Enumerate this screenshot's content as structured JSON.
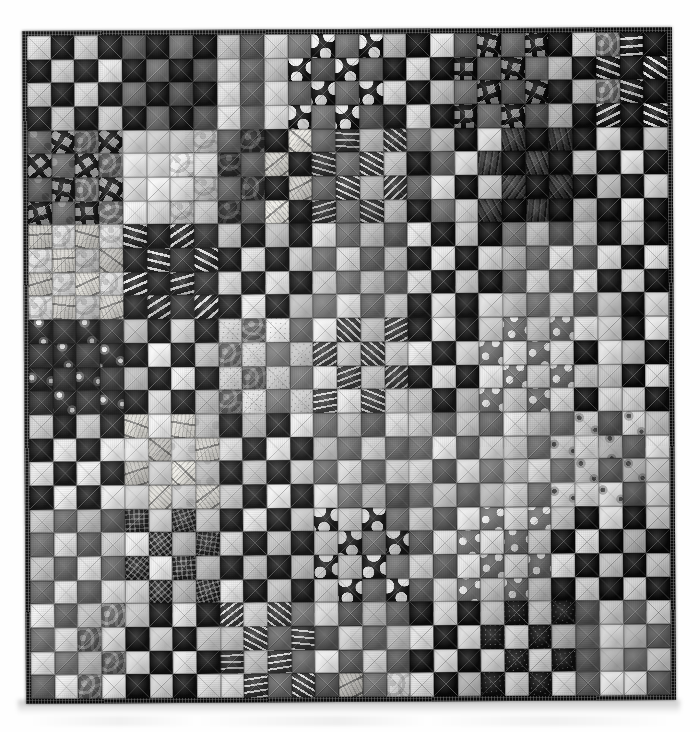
{
  "image": {
    "subject": "patchwork-quilt",
    "title": "Black and white scrappy checkerboard patchwork quilt",
    "background_color": "#ffffff",
    "orientation": "square"
  },
  "quilt": {
    "pattern_name": "Single Irish Chain / scrappy checkerboard",
    "colorway": "black and white",
    "columns": 27,
    "rows": 28,
    "binding_color": "#0d0d0d",
    "binding_label": "pieced black-and-white binding",
    "quilting_label": "diagonal crosshatch machine quilting",
    "fabric_legend": [
      {
        "key": "f-blk",
        "label": "solid black"
      },
      {
        "key": "f-dot-lgw",
        "label": "large white dots on black"
      },
      {
        "key": "f-dot-md",
        "label": "white dots on grey"
      },
      {
        "key": "f-grid-bold",
        "label": "bold black window-pane grid on grey"
      },
      {
        "key": "f-check-fine",
        "label": "fine black gingham check"
      },
      {
        "key": "f-strip-h",
        "label": "white ticking stripe on black"
      },
      {
        "key": "f-strip-v",
        "label": "vertical stripe"
      },
      {
        "key": "f-floral-d",
        "label": "white floral on black"
      },
      {
        "key": "f-floral-l",
        "label": "black floral on white"
      },
      {
        "key": "f-text-l",
        "label": "black script text print on cream"
      },
      {
        "key": "f-swirl-m",
        "label": "grey tonal swirl"
      },
      {
        "key": "f-speck-d",
        "label": "white speckle on black"
      },
      {
        "key": "f-net-d",
        "label": "black crosshatch net"
      },
      {
        "key": "f-wht",
        "label": "white tonal"
      }
    ],
    "grid": [
      [
        "f-lt2",
        "f-blk",
        "f-wht",
        "f-blk2",
        "f-md",
        "f-blk",
        "f-md2",
        "f-blk",
        "f-lt2",
        "f-md",
        "f-wht",
        "f-md2",
        "f-dot-lgw",
        "f-md2",
        "f-dot-lgw",
        "f-lt2",
        "f-blk",
        "f-lt2",
        "f-md",
        "f-grid-bold",
        "f-md2",
        "f-grid-bold",
        "f-blk",
        "f-wht",
        "f-swirl-m",
        "f-strip-h",
        "f-blk"
      ],
      [
        "f-blk",
        "f-wht",
        "f-blk2",
        "f-lt2",
        "f-blk",
        "f-md2",
        "f-blk",
        "f-md",
        "f-wht",
        "f-md2",
        "f-lt2",
        "f-dot-lgw",
        "f-md",
        "f-dot-lgw",
        "f-md2",
        "f-blk",
        "f-wht2",
        "f-blk",
        "f-grid-bold",
        "f-md",
        "f-grid-bold",
        "f-md2",
        "f-lt2",
        "f-blk",
        "f-strip-h",
        "f-blk2",
        "f-strip-h"
      ],
      [
        "f-wht",
        "f-blk",
        "f-lt2",
        "f-blk2",
        "f-md2",
        "f-blk",
        "f-md",
        "f-blk",
        "f-lt2",
        "f-md",
        "f-wht2",
        "f-md2",
        "f-dot-lgw",
        "f-md2",
        "f-dot-lgw",
        "f-wht",
        "f-blk",
        "f-lt2",
        "f-md2",
        "f-grid-bold",
        "f-md",
        "f-grid-bold",
        "f-blk2",
        "f-lt2",
        "f-swirl-m",
        "f-strip-h",
        "f-blk"
      ],
      [
        "f-blk2",
        "f-lt2",
        "f-blk",
        "f-wht",
        "f-blk",
        "f-md2",
        "f-blk",
        "f-md",
        "f-wht",
        "f-md2",
        "f-lt2",
        "f-dot-lgw",
        "f-md2",
        "f-dot-lgw",
        "f-md",
        "f-blk2",
        "f-wht",
        "f-blk",
        "f-grid-bold",
        "f-md2",
        "f-grid-bold",
        "f-md",
        "f-lt2",
        "f-blk",
        "f-strip-h",
        "f-blk",
        "f-strip-h"
      ],
      [
        "f-mottle-m",
        "f-grid-bold",
        "f-swirl-m",
        "f-grid-bold",
        "f-lt2",
        "f-wht",
        "f-lt2",
        "f-swirl-l",
        "f-md",
        "f-swirl-d",
        "f-blk",
        "f-text-l",
        "f-md2",
        "f-strip-h2",
        "f-lt2",
        "f-strip-h2",
        "f-md2",
        "f-lt2",
        "f-blk",
        "f-lt2",
        "f-grain",
        "f-blk",
        "f-grain",
        "f-blk",
        "f-lt2",
        "f-blk",
        "f-wht"
      ],
      [
        "f-grid-bold",
        "f-mottle-m",
        "f-grid-bold",
        "f-swirl-m",
        "f-wht",
        "f-lt2",
        "f-swirl-l",
        "f-lt2",
        "f-swirl-d",
        "f-md",
        "f-text-l",
        "f-blk",
        "f-strip-h2",
        "f-md2",
        "f-strip-h2",
        "f-lt2",
        "f-blk",
        "f-md2",
        "f-lt2",
        "f-grain",
        "f-blk",
        "f-grain",
        "f-blk",
        "f-lt2",
        "f-blk",
        "f-wht",
        "f-blk"
      ],
      [
        "f-mottle-m",
        "f-grid-bold",
        "f-swirl-m",
        "f-grid-bold",
        "f-lt2",
        "f-wht",
        "f-lt2",
        "f-swirl-l",
        "f-md",
        "f-swirl-d",
        "f-blk",
        "f-text-l",
        "f-md2",
        "f-strip-h2",
        "f-lt2",
        "f-strip-h2",
        "f-md2",
        "f-lt2",
        "f-blk",
        "f-lt2",
        "f-grain",
        "f-blk",
        "f-grain",
        "f-blk",
        "f-lt2",
        "f-blk",
        "f-wht"
      ],
      [
        "f-grid-bold",
        "f-mottle-m",
        "f-grid-bold",
        "f-swirl-m",
        "f-wht",
        "f-lt2",
        "f-swirl-l",
        "f-lt2",
        "f-swirl-d",
        "f-md",
        "f-text-l",
        "f-blk",
        "f-strip-h2",
        "f-md2",
        "f-strip-h2",
        "f-lt2",
        "f-blk",
        "f-md2",
        "f-lt2",
        "f-grain",
        "f-blk",
        "f-grain",
        "f-blk",
        "f-lt2",
        "f-blk",
        "f-wht",
        "f-blk"
      ],
      [
        "f-text-l",
        "f-swirl-l",
        "f-text-l",
        "f-swirl-l",
        "f-strip-h",
        "f-blk2",
        "f-strip-h",
        "f-dk",
        "f-wht",
        "f-blk",
        "f-lt2",
        "f-blk",
        "f-lt2",
        "f-md2",
        "f-lt2",
        "f-md",
        "f-wht",
        "f-blk",
        "f-lt2",
        "f-blk",
        "f-md2",
        "f-lt2",
        "f-md",
        "f-wht",
        "f-blk2",
        "f-lt2",
        "f-blk"
      ],
      [
        "f-swirl-l",
        "f-text-l",
        "f-swirl-l",
        "f-text-l",
        "f-blk2",
        "f-strip-h",
        "f-dk",
        "f-strip-h",
        "f-blk",
        "f-wht",
        "f-blk",
        "f-lt2",
        "f-md2",
        "f-lt2",
        "f-md",
        "f-lt2",
        "f-blk",
        "f-wht",
        "f-blk",
        "f-lt2",
        "f-lt2",
        "f-md2",
        "f-wht",
        "f-md",
        "f-lt2",
        "f-blk",
        "f-wht"
      ],
      [
        "f-text-l",
        "f-swirl-l",
        "f-text-l",
        "f-swirl-l",
        "f-strip-h",
        "f-blk2",
        "f-strip-h",
        "f-dk",
        "f-wht",
        "f-blk",
        "f-lt2",
        "f-blk",
        "f-lt2",
        "f-md2",
        "f-lt2",
        "f-md",
        "f-wht",
        "f-blk",
        "f-lt2",
        "f-blk",
        "f-md2",
        "f-lt2",
        "f-md",
        "f-wht",
        "f-blk2",
        "f-lt2",
        "f-blk"
      ],
      [
        "f-swirl-l",
        "f-text-l",
        "f-swirl-l",
        "f-text-l",
        "f-blk2",
        "f-strip-h",
        "f-dk",
        "f-strip-h",
        "f-blk",
        "f-wht",
        "f-blk",
        "f-lt2",
        "f-md2",
        "f-lt2",
        "f-md",
        "f-lt2",
        "f-blk",
        "f-wht",
        "f-blk",
        "f-lt2",
        "f-lt2",
        "f-md2",
        "f-wht",
        "f-md",
        "f-lt2",
        "f-blk",
        "f-wht"
      ],
      [
        "f-floral-d",
        "f-dk",
        "f-floral-d",
        "f-dk2",
        "f-lt2",
        "f-blk",
        "f-wht",
        "f-blk",
        "f-speck-l",
        "f-swirl-m",
        "f-speck-l",
        "f-md2",
        "f-wht",
        "f-strip-h2",
        "f-lt2",
        "f-strip-h2",
        "f-blk",
        "f-lt2",
        "f-blk",
        "f-wht",
        "f-dot-md",
        "f-lt2",
        "f-dot-md",
        "f-wht",
        "f-lt2",
        "f-blk",
        "f-wht"
      ],
      [
        "f-dk",
        "f-floral-d",
        "f-dk2",
        "f-floral-d",
        "f-blk",
        "f-wht",
        "f-blk",
        "f-lt2",
        "f-swirl-m",
        "f-speck-l",
        "f-md2",
        "f-speck-l",
        "f-strip-h2",
        "f-wht",
        "f-strip-h2",
        "f-lt2",
        "f-wht",
        "f-blk",
        "f-lt2",
        "f-dot-md",
        "f-wht",
        "f-dot-md",
        "f-lt2",
        "f-blk",
        "f-wht",
        "f-lt2",
        "f-blk"
      ],
      [
        "f-floral-d",
        "f-dk",
        "f-floral-d",
        "f-dk2",
        "f-lt2",
        "f-blk",
        "f-wht",
        "f-blk",
        "f-speck-l",
        "f-swirl-m",
        "f-speck-l",
        "f-md2",
        "f-wht",
        "f-strip-h2",
        "f-lt2",
        "f-strip-h2",
        "f-blk",
        "f-lt2",
        "f-blk",
        "f-wht",
        "f-dot-md",
        "f-lt2",
        "f-dot-md",
        "f-wht",
        "f-lt2",
        "f-blk",
        "f-wht"
      ],
      [
        "f-dk",
        "f-floral-d",
        "f-dk2",
        "f-floral-d",
        "f-blk",
        "f-wht",
        "f-blk",
        "f-lt2",
        "f-swirl-m",
        "f-speck-l",
        "f-md2",
        "f-speck-l",
        "f-strip-h2",
        "f-wht",
        "f-strip-h2",
        "f-lt2",
        "f-wht",
        "f-blk",
        "f-lt2",
        "f-dot-md",
        "f-wht",
        "f-dot-md",
        "f-lt2",
        "f-blk",
        "f-wht",
        "f-lt2",
        "f-blk"
      ],
      [
        "f-wht2",
        "f-blk",
        "f-wht2",
        "f-blk2",
        "f-text-l",
        "f-wht2",
        "f-text-l",
        "f-mottle-l",
        "f-blk",
        "f-lt2",
        "f-blk",
        "f-wht",
        "f-md2",
        "f-lt2",
        "f-md",
        "f-lt2",
        "f-wht",
        "f-md",
        "f-lt2",
        "f-md2",
        "f-wht",
        "f-lt2",
        "f-md2",
        "f-floral-l",
        "f-md",
        "f-floral-l",
        "f-lt2"
      ],
      [
        "f-blk",
        "f-wht2",
        "f-blk2",
        "f-wht2",
        "f-wht2",
        "f-text-l",
        "f-mottle-l",
        "f-text-l",
        "f-lt2",
        "f-blk",
        "f-wht",
        "f-blk",
        "f-lt2",
        "f-md2",
        "f-lt2",
        "f-md",
        "f-md2",
        "f-wht",
        "f-md",
        "f-lt2",
        "f-lt2",
        "f-md2",
        "f-floral-l",
        "f-lt2",
        "f-floral-l",
        "f-md",
        "f-wht"
      ],
      [
        "f-wht2",
        "f-blk",
        "f-wht2",
        "f-blk2",
        "f-text-l",
        "f-wht2",
        "f-text-l",
        "f-mottle-l",
        "f-blk",
        "f-lt2",
        "f-blk",
        "f-wht",
        "f-md2",
        "f-lt2",
        "f-md",
        "f-lt2",
        "f-wht",
        "f-md",
        "f-lt2",
        "f-md2",
        "f-wht",
        "f-lt2",
        "f-md2",
        "f-floral-l",
        "f-md",
        "f-floral-l",
        "f-lt2"
      ],
      [
        "f-blk",
        "f-wht2",
        "f-blk2",
        "f-wht2",
        "f-wht2",
        "f-text-l",
        "f-mottle-l",
        "f-text-l",
        "f-lt2",
        "f-blk",
        "f-wht",
        "f-blk",
        "f-lt2",
        "f-md2",
        "f-lt2",
        "f-md",
        "f-md2",
        "f-wht",
        "f-md",
        "f-lt2",
        "f-lt2",
        "f-md2",
        "f-floral-l",
        "f-lt2",
        "f-floral-l",
        "f-md",
        "f-wht"
      ],
      [
        "f-lt2",
        "f-md2",
        "f-lt2",
        "f-md",
        "f-net-d",
        "f-wht",
        "f-net-d",
        "f-lt2",
        "f-blk",
        "f-wht",
        "f-blk",
        "f-lt2",
        "f-dot-lgw",
        "f-lt2",
        "f-dot-lgw",
        "f-md2",
        "f-lt2",
        "f-md",
        "f-wht",
        "f-dot-md",
        "f-lt2",
        "f-dot-md",
        "f-wht",
        "f-blk",
        "f-lt2",
        "f-blk",
        "f-wht"
      ],
      [
        "f-md2",
        "f-lt2",
        "f-md",
        "f-lt2",
        "f-wht",
        "f-net-d",
        "f-lt2",
        "f-net-d",
        "f-wht",
        "f-blk",
        "f-lt2",
        "f-blk",
        "f-lt2",
        "f-dot-lgw",
        "f-md2",
        "f-dot-lgw",
        "f-md",
        "f-lt2",
        "f-dot-md",
        "f-wht",
        "f-dot-md",
        "f-lt2",
        "f-blk",
        "f-wht",
        "f-blk",
        "f-lt2",
        "f-blk"
      ],
      [
        "f-lt2",
        "f-md2",
        "f-lt2",
        "f-md",
        "f-net-d",
        "f-wht",
        "f-net-d",
        "f-lt2",
        "f-blk",
        "f-wht",
        "f-blk",
        "f-lt2",
        "f-dot-lgw",
        "f-lt2",
        "f-dot-lgw",
        "f-md2",
        "f-lt2",
        "f-md",
        "f-wht",
        "f-dot-md",
        "f-lt2",
        "f-dot-md",
        "f-wht",
        "f-blk",
        "f-lt2",
        "f-blk",
        "f-wht"
      ],
      [
        "f-md2",
        "f-lt2",
        "f-md",
        "f-lt2",
        "f-wht",
        "f-net-d",
        "f-lt2",
        "f-net-d",
        "f-wht",
        "f-blk",
        "f-lt2",
        "f-blk",
        "f-lt2",
        "f-dot-lgw",
        "f-md2",
        "f-dot-lgw",
        "f-md",
        "f-lt2",
        "f-dot-md",
        "f-wht",
        "f-dot-md",
        "f-lt2",
        "f-blk",
        "f-wht",
        "f-blk",
        "f-lt2",
        "f-blk"
      ],
      [
        "f-wht",
        "f-md2",
        "f-lt2",
        "f-swirl-m",
        "f-lt2",
        "f-blk",
        "f-wht",
        "f-blk",
        "f-strip-h2",
        "f-lt2",
        "f-strip-h2",
        "f-md2",
        "f-wht",
        "f-md",
        "f-lt2",
        "f-md2",
        "f-blk",
        "f-wht",
        "f-blk",
        "f-lt2",
        "f-speck-d",
        "f-lt2",
        "f-speck-d",
        "f-md",
        "f-lt2",
        "f-md2",
        "f-wht"
      ],
      [
        "f-md2",
        "f-wht",
        "f-swirl-m",
        "f-lt2",
        "f-blk",
        "f-wht",
        "f-blk",
        "f-lt2",
        "f-lt2",
        "f-strip-h2",
        "f-md2",
        "f-strip-h2",
        "f-md",
        "f-wht",
        "f-md2",
        "f-lt2",
        "f-wht",
        "f-blk",
        "f-lt2",
        "f-speck-d",
        "f-lt2",
        "f-speck-d",
        "f-lt2",
        "f-md2",
        "f-wht",
        "f-lt2",
        "f-md"
      ],
      [
        "f-wht",
        "f-md2",
        "f-lt2",
        "f-swirl-m",
        "f-lt2",
        "f-blk",
        "f-wht",
        "f-blk",
        "f-strip-h2",
        "f-lt2",
        "f-strip-h2",
        "f-md2",
        "f-wht",
        "f-md",
        "f-lt2",
        "f-md2",
        "f-blk",
        "f-wht",
        "f-blk",
        "f-lt2",
        "f-speck-d",
        "f-lt2",
        "f-speck-d",
        "f-md",
        "f-lt2",
        "f-md2",
        "f-wht"
      ],
      [
        "f-md2",
        "f-wht",
        "f-swirl-m",
        "f-lt2",
        "f-blk",
        "f-wht",
        "f-blk",
        "f-lt2",
        "f-lt2",
        "f-strip-h2",
        "f-md2",
        "f-strip-h2",
        "f-md",
        "f-text-l",
        "f-md2",
        "f-swirl-l",
        "f-wht",
        "f-blk",
        "f-lt2",
        "f-speck-d",
        "f-lt2",
        "f-speck-d",
        "f-lt2",
        "f-md2",
        "f-wht",
        "f-lt2",
        "f-md"
      ]
    ]
  }
}
